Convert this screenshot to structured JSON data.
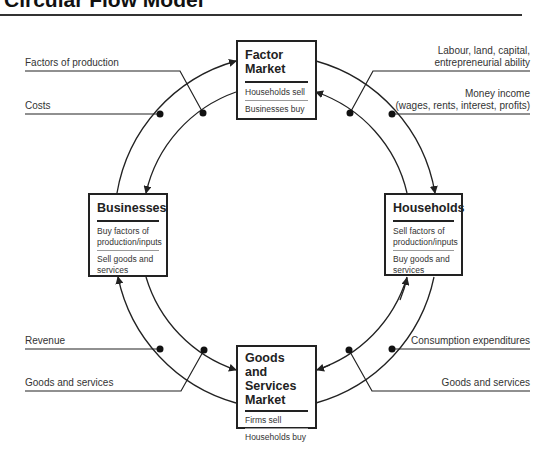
{
  "title": "Circular Flow Model",
  "boxes": {
    "factor_market": {
      "heading_line1": "Factor",
      "heading_line2": "Market",
      "items": [
        "Households sell",
        "Businesses buy"
      ]
    },
    "businesses": {
      "heading": "Businesses",
      "items": [
        "Buy factors of production/inputs",
        "Sell goods and services"
      ]
    },
    "households": {
      "heading": "Households",
      "items": [
        "Sell factors of production/inputs",
        "Buy goods and services"
      ]
    },
    "goods_services_market": {
      "heading_line1": "Goods and",
      "heading_line2": "Services",
      "heading_line3": "Market",
      "items": [
        "Firms sell",
        "Households buy"
      ]
    }
  },
  "labels": {
    "top_left_outer": "Factors of production",
    "top_left_inner": "Costs",
    "top_right_outer_line1": "Labour, land, capital,",
    "top_right_outer_line2": "entrepreneurial ability",
    "top_right_inner_line1": "Money income",
    "top_right_inner_line2": "(wages, rents, interest, profits)",
    "bottom_left_inner": "Revenue",
    "bottom_left_outer": "Goods and services",
    "bottom_right_inner": "Consumption expenditures",
    "bottom_right_outer": "Goods and services"
  },
  "colors": {
    "line": "#222222",
    "text": "#333333",
    "background": "#ffffff"
  }
}
